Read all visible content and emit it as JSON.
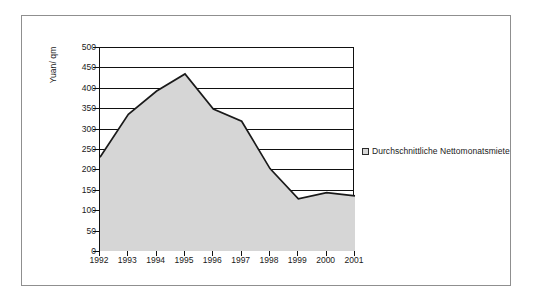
{
  "chart_data": {
    "type": "area",
    "title": "",
    "xlabel": "",
    "ylabel": "Yuan/ qm",
    "categories": [
      "1992",
      "1993",
      "1994",
      "1995",
      "1996",
      "1997",
      "1998",
      "1999",
      "2000",
      "2001"
    ],
    "series": [
      {
        "name": "Durchschnittliche Nettomonatsmiete",
        "values": [
          230,
          335,
          392,
          434,
          348,
          318,
          202,
          128,
          143,
          135
        ]
      }
    ],
    "ylim": [
      0,
      500
    ],
    "ytick_values": [
      0,
      50,
      100,
      150,
      200,
      250,
      300,
      350,
      400,
      450,
      500
    ],
    "ytick_labels": [
      "0",
      "50",
      "100",
      "150",
      "200",
      "250",
      "300",
      "350",
      "400",
      "450",
      "500"
    ],
    "grid": true,
    "legend_position": "right",
    "legend_entries": [
      "Durchschnittliche Nettomonatsmiete"
    ],
    "colors": {
      "area_fill": "#d6d6d6",
      "line": "#1a1a1a",
      "axis": "#111111",
      "grid": "#111111",
      "frame": "#8f8f8f",
      "text": "#1a1a1a",
      "background": "#ffffff"
    }
  },
  "legend": {
    "swatch_icon": "legend-square-icon",
    "label": "Durchschnittliche Nettomonatsmiete"
  },
  "axes": {
    "y_title": "Yuan/ qm"
  }
}
